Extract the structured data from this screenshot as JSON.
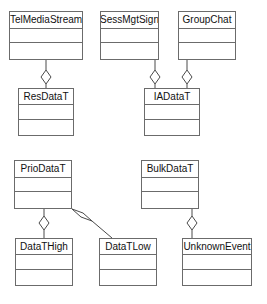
{
  "diagram": {
    "type": "uml-class-diagram",
    "canvas": {
      "width": 267,
      "height": 304,
      "background": "#ffffff"
    },
    "style": {
      "box_stroke": "#6b6b6b",
      "box_fill": "#ffffff",
      "edge_stroke": "#4a4a4a",
      "diamond_fill": "#ffffff",
      "text_color": "#111111"
    },
    "classes": [
      {
        "id": "telmediastream",
        "name": "TelMediaStream",
        "x": 9,
        "y": 11,
        "w": 74,
        "h": 49,
        "attributes": [],
        "operations": []
      },
      {
        "id": "sessmgtsign",
        "name": "SessMgtSign",
        "x": 100,
        "y": 11,
        "w": 59,
        "h": 49,
        "attributes": [],
        "operations": []
      },
      {
        "id": "groupchat",
        "name": "GroupChat",
        "x": 178,
        "y": 11,
        "w": 58,
        "h": 49,
        "attributes": [],
        "operations": []
      },
      {
        "id": "resdatat",
        "name": "ResDataT",
        "x": 18,
        "y": 88,
        "w": 56,
        "h": 48,
        "attributes": [],
        "operations": []
      },
      {
        "id": "iadatat",
        "name": "IADataT",
        "x": 144,
        "y": 88,
        "w": 56,
        "h": 48,
        "attributes": [],
        "operations": []
      },
      {
        "id": "priodatat",
        "name": "PrioDataT",
        "x": 14,
        "y": 160,
        "w": 58,
        "h": 49,
        "attributes": [],
        "operations": []
      },
      {
        "id": "bulkdatat",
        "name": "BulkDataT",
        "x": 141,
        "y": 160,
        "w": 58,
        "h": 49,
        "attributes": [],
        "operations": []
      },
      {
        "id": "datathigh",
        "name": "DataTHigh",
        "x": 15,
        "y": 238,
        "w": 58,
        "h": 48,
        "attributes": [],
        "operations": []
      },
      {
        "id": "datatlow",
        "name": "DataTLow",
        "x": 99,
        "y": 238,
        "w": 58,
        "h": 48,
        "attributes": [],
        "operations": []
      },
      {
        "id": "unknownevent",
        "name": "UnknownEvent",
        "x": 182,
        "y": 238,
        "w": 70,
        "h": 48,
        "attributes": [],
        "operations": []
      }
    ],
    "relationships": [
      {
        "id": "rel-1",
        "kind": "aggregation",
        "from": "telmediastream",
        "to": "resdatat",
        "label": ""
      },
      {
        "id": "rel-2",
        "kind": "aggregation",
        "from": "sessmgtsign",
        "to": "iadatat",
        "label": ""
      },
      {
        "id": "rel-3",
        "kind": "aggregation",
        "from": "groupchat",
        "to": "iadatat",
        "label": ""
      },
      {
        "id": "rel-4",
        "kind": "aggregation",
        "from": "priodatat",
        "to": "datathigh",
        "label": ""
      },
      {
        "id": "rel-5",
        "kind": "aggregation",
        "from": "priodatat",
        "to": "datatlow",
        "label": ""
      },
      {
        "id": "rel-6",
        "kind": "aggregation",
        "from": "bulkdatat",
        "to": "unknownevent",
        "label": ""
      }
    ]
  }
}
